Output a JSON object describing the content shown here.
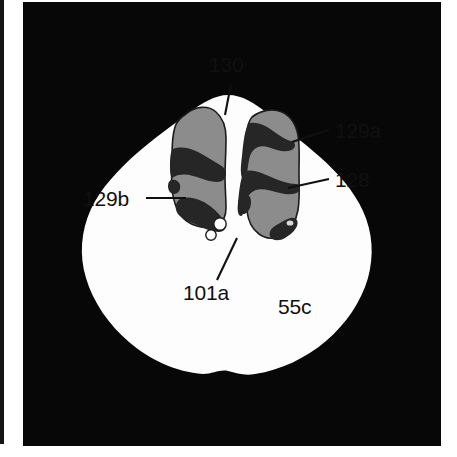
{
  "figure": {
    "kind": "ct-axial-slice-illustration",
    "background_color": "#ffffff",
    "scan_background_color": "#070707",
    "body_fill_color": "#fdfdfd",
    "organ_gray_color": "#8c8c8c",
    "organ_dark_color": "#262626",
    "void_white_color": "#ffffff",
    "label_color": "#101010",
    "margin_bar_color": "#141414"
  },
  "labels": {
    "top_center": "130",
    "right_upper": "129a",
    "right_lower": "128",
    "left_middle": "129b",
    "bottom_center": "101a",
    "bottom_right": "55c"
  },
  "regions": [
    {
      "id": "body-outline",
      "name": "body-cross-section",
      "label_ref": "55c"
    },
    {
      "id": "midline-fissure",
      "name": "midline-gap",
      "label_ref": "130"
    },
    {
      "id": "right-lobe-upper",
      "name": "right-lobe-upper-gray",
      "label_ref": "129a"
    },
    {
      "id": "right-lobe-band",
      "name": "right-lobe-dark-band",
      "label_ref": "128"
    },
    {
      "id": "left-lobe-lower",
      "name": "left-lobe-lower-gray",
      "label_ref": "129b"
    },
    {
      "id": "void-circles",
      "name": "small-white-voids",
      "label_ref": "101a"
    }
  ]
}
